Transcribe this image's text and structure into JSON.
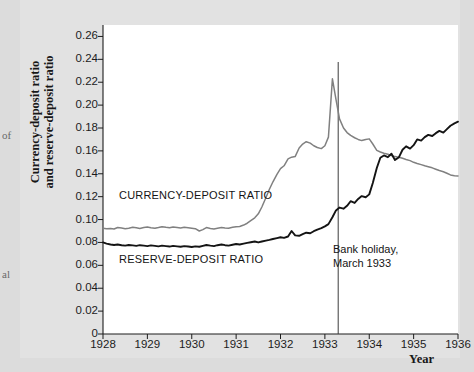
{
  "chart_data": {
    "type": "line",
    "title": "",
    "xlabel": "Year",
    "ylabel": "Currency-deposit ratio\nand reserve-deposit ratio",
    "xlim": [
      1928,
      1936
    ],
    "ylim": [
      0,
      0.27
    ],
    "grid": false,
    "legend_position": "inline-labels",
    "y_ticks": [
      "0.26",
      "0.24",
      "0.22",
      "0.20",
      "0.18",
      "0.16",
      "0.14",
      "0.12",
      "0.10",
      "0.08",
      "0.06",
      "0.04",
      "0.02",
      "0"
    ],
    "y_tick_values": [
      0.26,
      0.24,
      0.22,
      0.2,
      0.18,
      0.16,
      0.14,
      0.12,
      0.1,
      0.08,
      0.06,
      0.04,
      0.02,
      0
    ],
    "x_ticks": [
      "1928",
      "1929",
      "1930",
      "1931",
      "1932",
      "1933",
      "1934",
      "1935",
      "1936"
    ],
    "x_tick_values": [
      1928,
      1929,
      1930,
      1931,
      1932,
      1933,
      1934,
      1935,
      1936
    ],
    "annotations": [
      {
        "name": "bank-holiday",
        "text": "Bank holiday,\nMarch 1933",
        "x": 1933.3,
        "line": true
      }
    ],
    "series": [
      {
        "name": "CURRENCY-DEPOSIT RATIO",
        "color": "#808080",
        "label_x": 1928.4,
        "x": [
          1928.0,
          1928.08,
          1928.17,
          1928.25,
          1928.33,
          1928.42,
          1928.5,
          1928.58,
          1928.67,
          1928.75,
          1928.83,
          1928.92,
          1929.0,
          1929.08,
          1929.17,
          1929.25,
          1929.33,
          1929.42,
          1929.5,
          1929.58,
          1929.67,
          1929.75,
          1929.83,
          1929.92,
          1930.0,
          1930.08,
          1930.17,
          1930.25,
          1930.33,
          1930.42,
          1930.5,
          1930.58,
          1930.67,
          1930.75,
          1930.83,
          1930.92,
          1931.0,
          1931.08,
          1931.17,
          1931.25,
          1931.33,
          1931.42,
          1931.5,
          1931.58,
          1931.67,
          1931.75,
          1931.83,
          1931.92,
          1932.0,
          1932.08,
          1932.17,
          1932.25,
          1932.33,
          1932.42,
          1932.5,
          1932.58,
          1932.67,
          1932.75,
          1932.83,
          1932.92,
          1933.0,
          1933.08,
          1933.17,
          1933.25,
          1933.33,
          1933.42,
          1933.5,
          1933.58,
          1933.67,
          1933.75,
          1933.83,
          1933.92,
          1934.0,
          1934.08,
          1934.17,
          1934.25,
          1934.33,
          1934.42,
          1934.5,
          1934.58,
          1934.67,
          1934.75,
          1934.83,
          1934.92,
          1935.0,
          1935.08,
          1935.17,
          1935.25,
          1935.33,
          1935.42,
          1935.5,
          1935.58,
          1935.67,
          1935.75,
          1935.83,
          1935.92,
          1936.0
        ],
        "y": [
          0.0925,
          0.092,
          0.0922,
          0.0918,
          0.093,
          0.0926,
          0.092,
          0.0924,
          0.0932,
          0.0928,
          0.0922,
          0.093,
          0.0935,
          0.0928,
          0.0924,
          0.093,
          0.0938,
          0.0932,
          0.0928,
          0.0934,
          0.093,
          0.0926,
          0.0932,
          0.0928,
          0.0924,
          0.092,
          0.09,
          0.0912,
          0.093,
          0.0922,
          0.0918,
          0.0924,
          0.093,
          0.0926,
          0.0924,
          0.0932,
          0.0938,
          0.094,
          0.0952,
          0.0968,
          0.099,
          0.1015,
          0.105,
          0.111,
          0.119,
          0.1265,
          0.133,
          0.1395,
          0.1445,
          0.147,
          0.153,
          0.1545,
          0.155,
          0.1625,
          0.166,
          0.168,
          0.1668,
          0.1645,
          0.163,
          0.162,
          0.1645,
          0.172,
          0.223,
          0.205,
          0.188,
          0.18,
          0.176,
          0.1735,
          0.1715,
          0.17,
          0.169,
          0.17,
          0.1705,
          0.166,
          0.1605,
          0.159,
          0.158,
          0.157,
          0.156,
          0.155,
          0.1545,
          0.1535,
          0.1525,
          0.1515,
          0.15,
          0.149,
          0.148,
          0.147,
          0.1462,
          0.1452,
          0.144,
          0.1428,
          0.1418,
          0.1405,
          0.139,
          0.1382,
          0.138
        ]
      },
      {
        "name": "RESERVE-DEPOSIT RATIO",
        "color": "#141414",
        "label_x": 1928.4,
        "x": [
          1928.0,
          1928.08,
          1928.17,
          1928.25,
          1928.33,
          1928.42,
          1928.5,
          1928.58,
          1928.67,
          1928.75,
          1928.83,
          1928.92,
          1929.0,
          1929.08,
          1929.17,
          1929.25,
          1929.33,
          1929.42,
          1929.5,
          1929.58,
          1929.67,
          1929.75,
          1929.83,
          1929.92,
          1930.0,
          1930.08,
          1930.17,
          1930.25,
          1930.33,
          1930.42,
          1930.5,
          1930.58,
          1930.67,
          1930.75,
          1930.83,
          1930.92,
          1931.0,
          1931.08,
          1931.17,
          1931.25,
          1931.33,
          1931.42,
          1931.5,
          1931.58,
          1931.67,
          1931.75,
          1931.83,
          1931.92,
          1932.0,
          1932.08,
          1932.17,
          1932.25,
          1932.33,
          1932.42,
          1932.5,
          1932.58,
          1932.67,
          1932.75,
          1932.83,
          1932.92,
          1933.0,
          1933.08,
          1933.17,
          1933.25,
          1933.33,
          1933.42,
          1933.5,
          1933.58,
          1933.67,
          1933.75,
          1933.83,
          1933.92,
          1934.0,
          1934.08,
          1934.17,
          1934.25,
          1934.33,
          1934.42,
          1934.5,
          1934.58,
          1934.67,
          1934.75,
          1934.83,
          1934.92,
          1935.0,
          1935.08,
          1935.17,
          1935.25,
          1935.33,
          1935.42,
          1935.5,
          1935.58,
          1935.67,
          1935.75,
          1935.83,
          1935.92,
          1936.0
        ],
        "y": [
          0.08,
          0.079,
          0.0782,
          0.0778,
          0.0782,
          0.0776,
          0.0772,
          0.0778,
          0.0774,
          0.077,
          0.0776,
          0.0772,
          0.0768,
          0.0774,
          0.077,
          0.0766,
          0.0772,
          0.0768,
          0.0764,
          0.077,
          0.0766,
          0.0762,
          0.0768,
          0.0764,
          0.076,
          0.0766,
          0.0762,
          0.077,
          0.0778,
          0.0772,
          0.0768,
          0.0776,
          0.0782,
          0.0776,
          0.0772,
          0.078,
          0.0786,
          0.0782,
          0.079,
          0.0796,
          0.0802,
          0.0808,
          0.08,
          0.0808,
          0.0816,
          0.0822,
          0.083,
          0.0838,
          0.0845,
          0.084,
          0.0852,
          0.09,
          0.0862,
          0.0858,
          0.0872,
          0.0885,
          0.088,
          0.0898,
          0.0912,
          0.0925,
          0.094,
          0.096,
          0.102,
          0.108,
          0.1105,
          0.1095,
          0.112,
          0.116,
          0.1145,
          0.118,
          0.1205,
          0.1195,
          0.122,
          0.132,
          0.145,
          0.154,
          0.156,
          0.1545,
          0.1575,
          0.152,
          0.1545,
          0.161,
          0.164,
          0.162,
          0.165,
          0.17,
          0.169,
          0.172,
          0.174,
          0.173,
          0.1755,
          0.1775,
          0.176,
          0.179,
          0.182,
          0.184,
          0.1855
        ]
      }
    ]
  },
  "margin_fragments": {
    "top": "of",
    "bottom": "al"
  }
}
